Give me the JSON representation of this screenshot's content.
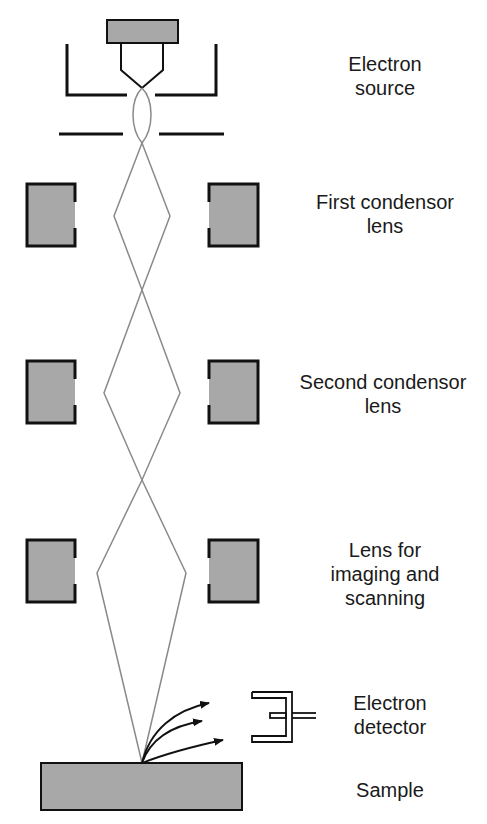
{
  "diagram": {
    "colors": {
      "fill": "#a8a8a8",
      "outline": "#111111",
      "beam": "#8a8a8a",
      "text": "#1a1a1a"
    },
    "labels": {
      "electron_source": {
        "line1": "Electron",
        "line2": "source"
      },
      "first_condensor": {
        "line1": "First condensor",
        "line2": "lens"
      },
      "second_condensor": {
        "line1": "Second condensor",
        "line2": "lens"
      },
      "imaging_lens": {
        "line1": "Lens for",
        "line2": "imaging and",
        "line3": "scanning"
      },
      "detector": {
        "line1": "Electron",
        "line2": "detector"
      },
      "sample": {
        "line1": "Sample"
      }
    }
  }
}
